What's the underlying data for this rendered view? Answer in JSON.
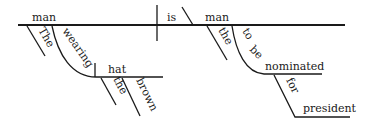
{
  "diagram": {
    "type": "sentence-diagram",
    "sentence": "The man wearing the brown hat is the man to be nominated for president",
    "subject": "man",
    "verb": "is",
    "predicate_nominative": "man",
    "modifiers": {
      "subject_article": "The",
      "participle": "wearing",
      "participle_object": "hat",
      "object_article": "the",
      "object_adjective": "brown",
      "complement_article": "the",
      "infinitive_part1": "to",
      "infinitive_part2": "be",
      "infinitive_verb": "nominated",
      "preposition": "for",
      "prepositional_object": "president"
    },
    "colors": {
      "line": "#1a1a1a",
      "text": "#1a1a1a",
      "background": "#ffffff"
    }
  }
}
